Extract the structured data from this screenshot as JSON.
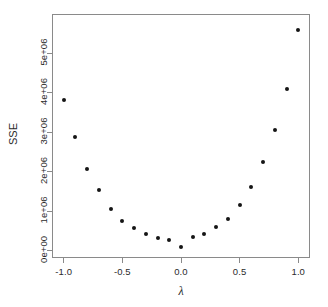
{
  "chart_data": {
    "type": "scatter",
    "title": "",
    "xlabel": "λ",
    "ylabel": "SSE",
    "xlim": [
      -1.1,
      1.1
    ],
    "ylim": [
      -180000,
      6000000
    ],
    "grid": false,
    "legend": null,
    "x_ticks": [
      -1.0,
      -0.5,
      0.0,
      0.5,
      1.0
    ],
    "x_tick_labels": [
      "-1.0",
      "-0.5",
      "0.0",
      "0.5",
      "1.0"
    ],
    "y_ticks": [
      0,
      1000000,
      2000000,
      3000000,
      4000000,
      5000000
    ],
    "y_tick_labels": [
      "0e+00",
      "1e+06",
      "2e+06",
      "3e+06",
      "4e+06",
      "5e+06"
    ],
    "x": [
      -1.0,
      -0.9,
      -0.8,
      -0.7,
      -0.6,
      -0.5,
      -0.4,
      -0.3,
      -0.2,
      -0.1,
      0.0,
      0.1,
      0.2,
      0.3,
      0.4,
      0.5,
      0.6,
      0.7,
      0.8,
      0.9,
      1.0
    ],
    "values": [
      3830000,
      2880000,
      2080000,
      1530000,
      1060000,
      760000,
      570000,
      420000,
      330000,
      280000,
      105000,
      350000,
      440000,
      600000,
      800000,
      1150000,
      1630000,
      2250000,
      3050000,
      4100000,
      5600000
    ],
    "point_color": "#151515",
    "point_size": 4,
    "axis_color": "#8a8a8a",
    "marker": "filled-circle"
  },
  "figure": {
    "background": "#ffffff",
    "axis_label_x": "λ",
    "axis_label_y": "SSE"
  }
}
